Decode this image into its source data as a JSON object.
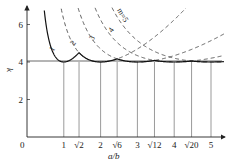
{
  "chart_data": {
    "type": "line",
    "title": "",
    "xlabel": "a/b",
    "ylabel": "k",
    "xlim": [
      0,
      5.4
    ],
    "ylim": [
      0,
      6.5
    ],
    "grid": false,
    "x_ticks": [
      {
        "value": 1,
        "label": "1"
      },
      {
        "value": 1.4142,
        "label": "√2"
      },
      {
        "value": 2,
        "label": "2"
      },
      {
        "value": 2.4495,
        "label": "√6"
      },
      {
        "value": 3,
        "label": "3"
      },
      {
        "value": 3.4641,
        "label": "√12"
      },
      {
        "value": 4,
        "label": "4"
      },
      {
        "value": 4.4721,
        "label": "√20"
      },
      {
        "value": 5,
        "label": "5"
      }
    ],
    "y_ticks": [
      {
        "value": 2,
        "label": "2"
      },
      {
        "value": 4,
        "label": "4"
      },
      {
        "value": 6,
        "label": "6"
      }
    ],
    "origin_label": "0",
    "formula": "k = (m·b/a + a/(m·b))^2",
    "series": [
      {
        "name": "1",
        "m": 1,
        "style": "solid-envelope",
        "min_at": 1,
        "min_k": 4
      },
      {
        "name": "2",
        "m": 2,
        "style": "dashed",
        "min_at": 2,
        "min_k": 4
      },
      {
        "name": "3",
        "m": 3,
        "style": "dashed",
        "min_at": 3,
        "min_k": 4
      },
      {
        "name": "4",
        "m": 4,
        "style": "dashed",
        "min_at": 4,
        "min_k": 4
      },
      {
        "name": "m=5",
        "m": 5,
        "style": "dashed",
        "min_at": 5,
        "min_k": 4
      }
    ],
    "envelope_transitions": [
      {
        "between": [
          1,
          2
        ],
        "x": 1.4142,
        "label": "√2"
      },
      {
        "between": [
          2,
          3
        ],
        "x": 2.4495,
        "label": "√6"
      },
      {
        "between": [
          3,
          4
        ],
        "x": 3.4641,
        "label": "√12"
      },
      {
        "between": [
          4,
          5
        ],
        "x": 4.4721,
        "label": "√20"
      }
    ],
    "reference_line": {
      "y": 4,
      "style": "solid"
    },
    "vertical_lines_at": [
      1,
      1.4142,
      2,
      2.4495,
      3,
      3.4641,
      4,
      4.4721,
      5
    ]
  },
  "labels": {
    "curve_1": "1",
    "curve_2": "2",
    "curve_3": "3",
    "curve_4": "4",
    "curve_5": "m=5"
  }
}
